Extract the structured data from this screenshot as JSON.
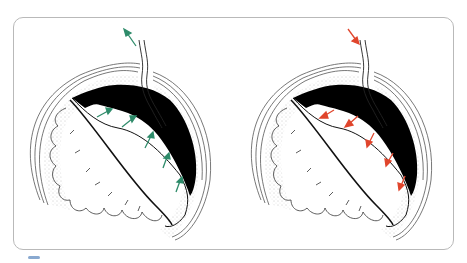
{
  "figure": {
    "panels": [
      {
        "id": "left",
        "label": "Drainage (outflow)",
        "arrow_color": "#2e8b6a",
        "arrow_direction": "outward"
      },
      {
        "id": "right",
        "label": "Irrigation (inflow)",
        "arrow_color": "#e0452c",
        "arrow_direction": "inward"
      }
    ],
    "colors": {
      "frame": "#b9b9b9",
      "outline": "#222222",
      "fluid": "#000000",
      "stipple": "#9a9a9a"
    }
  }
}
